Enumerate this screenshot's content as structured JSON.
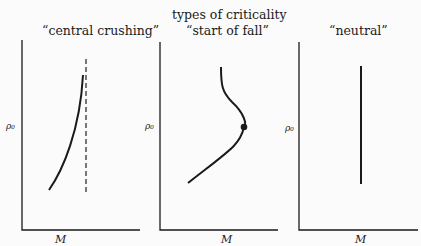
{
  "figure": {
    "title": "types of criticality",
    "panels": [
      {
        "id": "central-crushing",
        "label": "“central crushing”",
        "ylabel": "ρ₀",
        "xlabel": "M",
        "features": [
          "solid curve rising steeply to the right, concave",
          "dashed vertical asymptote to the right of the curve"
        ]
      },
      {
        "id": "start-of-fall",
        "label": "“start of fall”",
        "ylabel": "ρ₀",
        "xlabel": "M",
        "features": [
          "S-shaped curve with maximum-mass turning point",
          "filled dot marks the turning point"
        ]
      },
      {
        "id": "neutral",
        "label": "“neutral”",
        "ylabel": "ρ₀",
        "xlabel": "M",
        "features": [
          "vertical line at constant M"
        ]
      }
    ]
  },
  "colors": {
    "ink": "#1a1a1a",
    "dashed": "#555555",
    "background": "#fbfbfb"
  }
}
